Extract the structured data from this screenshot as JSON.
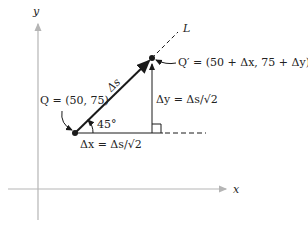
{
  "axes": {
    "x_label": "x",
    "y_label": "y",
    "color": "#b5b5b5"
  },
  "line_label": "L",
  "points": {
    "Q": {
      "label": "Q = (50, 75)"
    },
    "Q_prime": {
      "label": "Q′ = (50 + Δx, 75 + Δy)"
    }
  },
  "segments": {
    "hypotenuse_label": "Δs",
    "angle_label": "45°",
    "dx_label": "Δx = Δs/√2",
    "dy_label": "Δy = Δs/√2"
  },
  "colors": {
    "ink": "#1a1a1a",
    "axis": "#b5b5b5"
  }
}
